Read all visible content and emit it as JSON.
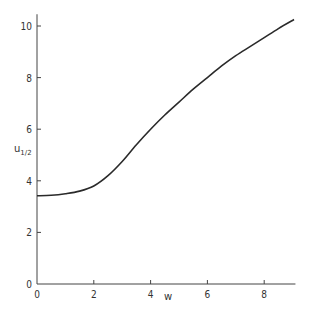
{
  "chart_data": {
    "type": "line",
    "title": "",
    "xlabel": "w",
    "ylabel": "u_1/2",
    "ylabel_main": "u",
    "ylabel_sub": "1/2",
    "xlim": [
      0,
      9.1
    ],
    "ylim": [
      0,
      10.3
    ],
    "xticks": [
      0,
      2,
      4,
      6,
      8
    ],
    "yticks": [
      0,
      2,
      4,
      6,
      8,
      10
    ],
    "xtick_labels": [
      "0",
      "2",
      "4",
      "6",
      "8"
    ],
    "ytick_labels": [
      "0",
      "2",
      "4",
      "6",
      "8",
      "10"
    ],
    "grid": false,
    "legend": null,
    "series": [
      {
        "name": "u_1/2",
        "x": [
          0,
          0.5,
          1.0,
          1.5,
          2.0,
          2.5,
          3.0,
          3.5,
          4.0,
          4.5,
          5.0,
          5.5,
          6.0,
          6.5,
          7.0,
          7.5,
          8.0,
          8.5,
          9.05
        ],
        "y": [
          3.42,
          3.44,
          3.5,
          3.6,
          3.8,
          4.2,
          4.75,
          5.4,
          6.0,
          6.55,
          7.05,
          7.55,
          8.0,
          8.45,
          8.85,
          9.2,
          9.55,
          9.9,
          10.25
        ]
      }
    ]
  }
}
